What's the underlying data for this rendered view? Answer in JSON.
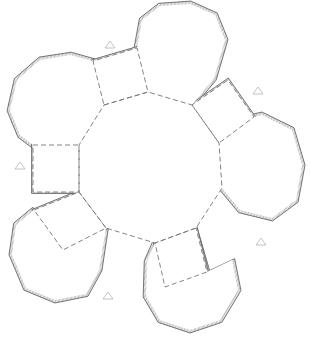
{
  "diagram": {
    "title": "",
    "type": "papercraft-net",
    "colors": {
      "hatch": "#bdbdbd",
      "edge": "#444444",
      "fold": "#777777",
      "mark": "#aaaaaa"
    },
    "center_decagon": [
      [
        104,
        105
      ],
      [
        148,
        92
      ],
      [
        192,
        105
      ],
      [
        219,
        143
      ],
      [
        222,
        188
      ],
      [
        196,
        228
      ],
      [
        155,
        243
      ],
      [
        106,
        228
      ],
      [
        79,
        192
      ],
      [
        79,
        145
      ]
    ],
    "squares": [
      [
        [
          104,
          105
        ],
        [
          148,
          92
        ],
        [
          137,
          48
        ],
        [
          93,
          61
        ]
      ],
      [
        [
          192,
          105
        ],
        [
          219,
          143
        ],
        [
          254,
          117
        ],
        [
          228,
          80
        ]
      ],
      [
        [
          196,
          228
        ],
        [
          155,
          243
        ],
        [
          165,
          287
        ],
        [
          207,
          272
        ]
      ],
      [
        [
          106,
          228
        ],
        [
          79,
          192
        ],
        [
          34,
          210
        ],
        [
          63,
          250
        ]
      ],
      [
        [
          79,
          192
        ],
        [
          79,
          145
        ],
        [
          33,
          145
        ],
        [
          33,
          192
        ]
      ]
    ],
    "decagons": [
      [
        [
          137,
          48
        ],
        [
          148,
          92
        ],
        [
          192,
          105
        ],
        [
          214,
          78
        ],
        [
          225,
          40
        ],
        [
          215,
          15
        ],
        [
          190,
          4
        ],
        [
          160,
          6
        ],
        [
          142,
          20
        ]
      ],
      [
        [
          219,
          143
        ],
        [
          222,
          188
        ],
        [
          240,
          210
        ],
        [
          272,
          218
        ],
        [
          296,
          200
        ],
        [
          302,
          165
        ],
        [
          292,
          130
        ],
        [
          262,
          115
        ],
        [
          254,
          117
        ]
      ],
      [
        [
          155,
          243
        ],
        [
          147,
          262
        ],
        [
          146,
          296
        ],
        [
          160,
          320
        ],
        [
          190,
          330
        ],
        [
          220,
          320
        ],
        [
          238,
          290
        ],
        [
          232,
          260
        ],
        [
          207,
          272
        ],
        [
          196,
          228
        ]
      ],
      [
        [
          63,
          250
        ],
        [
          34,
          210
        ],
        [
          16,
          225
        ],
        [
          12,
          255
        ],
        [
          26,
          288
        ],
        [
          55,
          300
        ],
        [
          86,
          294
        ],
        [
          99,
          270
        ],
        [
          106,
          228
        ]
      ],
      [
        [
          33,
          145
        ],
        [
          79,
          145
        ],
        [
          104,
          105
        ],
        [
          93,
          61
        ],
        [
          70,
          55
        ],
        [
          40,
          60
        ],
        [
          17,
          80
        ],
        [
          10,
          110
        ],
        [
          20,
          135
        ]
      ]
    ],
    "glue_marks": [
      [
        110,
        45
      ],
      [
        258,
        91
      ],
      [
        261,
        242
      ],
      [
        108,
        296
      ],
      [
        20,
        166
      ]
    ]
  }
}
